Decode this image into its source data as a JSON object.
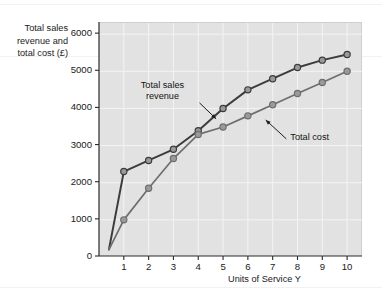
{
  "chart_data": {
    "type": "line",
    "title": "",
    "ylabel": "Total sales revenue and total cost (£)",
    "ylabel_lines": [
      "Total sales",
      "revenue and",
      "total cost (£)"
    ],
    "xlabel": "Units of Service Y",
    "x": [
      1,
      2,
      3,
      4,
      5,
      6,
      7,
      8,
      9,
      10
    ],
    "xlim": [
      0,
      10.6
    ],
    "ylim": [
      0,
      6300
    ],
    "xticks": [
      "1",
      "2",
      "3",
      "4",
      "5",
      "6",
      "7",
      "8",
      "9",
      "10"
    ],
    "yticks": [
      "0",
      "1000",
      "2000",
      "3000",
      "4000",
      "5000",
      "6000"
    ],
    "ytick_values": [
      0,
      1000,
      2000,
      3000,
      4000,
      5000,
      6000
    ],
    "grid": true,
    "legend": "annotations",
    "origin_point": {
      "x": 0.4,
      "y": 200
    },
    "series": [
      {
        "name": "Total sales revenue",
        "color": "#3c3c3c",
        "marker": "circle",
        "values": [
          2300,
          2600,
          2900,
          3400,
          4000,
          4500,
          4800,
          5100,
          5300,
          5450
        ]
      },
      {
        "name": "Total cost",
        "color": "#6e6e6e",
        "marker": "circle",
        "values": [
          1000,
          1850,
          2650,
          3300,
          3500,
          3800,
          4100,
          4400,
          4700,
          5000
        ]
      }
    ],
    "annotations": [
      {
        "name": "total-sales-revenue",
        "text_lines": [
          "Total sales",
          "revenue"
        ],
        "text": "Total sales revenue",
        "arrow_from": {
          "x": 4.05,
          "y": 4150
        },
        "arrow_to": {
          "x": 4.72,
          "y": 3720
        }
      },
      {
        "name": "total-cost",
        "text_lines": [
          "Total cost"
        ],
        "text": "Total cost",
        "arrow_from": {
          "x": 7.55,
          "y": 3180
        },
        "arrow_to": {
          "x": 6.72,
          "y": 3690
        }
      }
    ]
  },
  "colors": {
    "plot_background": "#e2e2e2",
    "page_background": "#ffffff",
    "grid": "#f4f4f4",
    "axis": "#2b2b2b",
    "revenue": "#3c3c3c",
    "cost": "#6e6e6e",
    "marker_fill": "#9a9a9a",
    "text": "#1a1a1a"
  }
}
